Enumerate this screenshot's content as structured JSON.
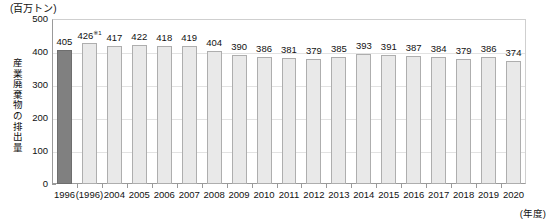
{
  "chart_data": {
    "type": "bar",
    "title": "",
    "unit_caption": "(百万トン)",
    "ylabel": "産業廃棄物の排出量",
    "xlabel": "(年度)",
    "ylim": [
      0,
      500
    ],
    "yticks": [
      0,
      100,
      200,
      300,
      400,
      500
    ],
    "ytick_labels": [
      "0",
      "100",
      "200",
      "300",
      "400",
      "500"
    ],
    "grid": true,
    "legend": "none",
    "categories": [
      "1996",
      "(1996)",
      "2004",
      "2005",
      "2006",
      "2007",
      "2008",
      "2009",
      "2010",
      "2011",
      "2012",
      "2013",
      "2014",
      "2015",
      "2016",
      "2017",
      "2018",
      "2019",
      "2020"
    ],
    "values": [
      405,
      426,
      417,
      422,
      418,
      419,
      404,
      390,
      386,
      381,
      379,
      385,
      393,
      391,
      387,
      384,
      379,
      386,
      374
    ],
    "value_labels": [
      "405",
      "426",
      "417",
      "422",
      "418",
      "419",
      "404",
      "390",
      "386",
      "381",
      "379",
      "385",
      "393",
      "391",
      "387",
      "384",
      "379",
      "386",
      "374"
    ],
    "annotations": [
      {
        "index": 1,
        "marker": "※1",
        "note": "426※1"
      }
    ],
    "highlight_index": 0,
    "colors": {
      "bar_fill": "#e9e9e9",
      "bar_border": "#aeaeae",
      "highlight_fill": "#808080",
      "highlight_border": "#6e6e6e",
      "axis": "#9a9a9a",
      "grid": "#e2e2e2",
      "text": "#111111"
    }
  },
  "yaxis_title_chars": [
    "産",
    "業",
    "廃",
    "棄",
    "物",
    "の",
    "排",
    "出",
    "量"
  ]
}
